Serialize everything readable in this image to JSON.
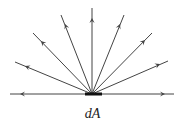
{
  "diagram": {
    "label": "dA",
    "center": [
      92,
      94
    ],
    "element_bar": {
      "x1": 85,
      "x2": 102,
      "y": 94,
      "thickness": 3
    },
    "rays": [
      {
        "name": "ray-left-horizontal",
        "end": [
          10,
          94
        ],
        "arrow": [
          20,
          94
        ]
      },
      {
        "name": "ray-left-low",
        "end": [
          15,
          62
        ],
        "arrow": [
          25,
          66
        ]
      },
      {
        "name": "ray-left-mid",
        "end": [
          33,
          33
        ],
        "arrow": [
          41,
          41
        ]
      },
      {
        "name": "ray-left-high",
        "end": [
          61,
          15
        ],
        "arrow": [
          65,
          24
        ]
      },
      {
        "name": "ray-vertical",
        "end": [
          92,
          8
        ],
        "arrow": [
          92,
          18
        ]
      },
      {
        "name": "ray-right-high",
        "end": [
          124,
          15
        ],
        "arrow": [
          120,
          24
        ]
      },
      {
        "name": "ray-right-mid",
        "end": [
          152,
          33
        ],
        "arrow": [
          145,
          40
        ]
      },
      {
        "name": "ray-right-low",
        "end": [
          168,
          61
        ],
        "arrow": [
          160,
          64
        ]
      },
      {
        "name": "ray-right-horizontal",
        "end": [
          174,
          94
        ],
        "arrow": [
          165,
          94
        ]
      }
    ],
    "colors": {
      "line": "#444444",
      "bar": "#111111",
      "text": "#222222"
    }
  }
}
